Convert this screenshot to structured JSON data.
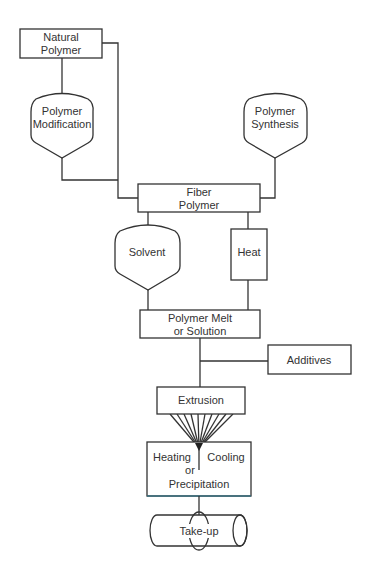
{
  "diagram": {
    "type": "flowchart",
    "colors": {
      "stroke": "#333333",
      "text": "#333333",
      "accent_edge": "#3a7080"
    },
    "nodes": {
      "natural_polymer": {
        "line1": "Natural",
        "line2": "Polymer",
        "shape": "rectangle"
      },
      "polymer_modification": {
        "line1": "Polymer",
        "line2": "Modification",
        "shape": "funnel"
      },
      "polymer_synthesis": {
        "line1": "Polymer",
        "line2": "Synthesis",
        "shape": "funnel"
      },
      "fiber_polymer": {
        "line1": "Fiber",
        "line2": "Polymer",
        "shape": "rectangle"
      },
      "solvent": {
        "line1": "Solvent",
        "shape": "funnel"
      },
      "heat": {
        "line1": "Heat",
        "shape": "rectangle"
      },
      "polymer_melt": {
        "line1": "Polymer Melt",
        "line2": "or Solution",
        "shape": "rectangle"
      },
      "additives": {
        "line1": "Additives",
        "shape": "rectangle"
      },
      "extrusion": {
        "line1": "Extrusion",
        "shape": "rectangle"
      },
      "heating_cooling": {
        "left": "Heating",
        "right": "Cooling",
        "line2": "or",
        "line3": "Precipitation",
        "shape": "rectangle"
      },
      "take_up": {
        "line1": "Take-up",
        "shape": "cylinder"
      }
    },
    "edges": [
      [
        "Natural Polymer",
        "Polymer Modification"
      ],
      [
        "Natural Polymer",
        "Fiber Polymer"
      ],
      [
        "Polymer Modification",
        "Fiber Polymer"
      ],
      [
        "Polymer Synthesis",
        "Fiber Polymer"
      ],
      [
        "Fiber Polymer",
        "Solvent"
      ],
      [
        "Fiber Polymer",
        "Heat"
      ],
      [
        "Solvent",
        "Polymer Melt or Solution"
      ],
      [
        "Heat",
        "Polymer Melt or Solution"
      ],
      [
        "Polymer Melt or Solution",
        "Extrusion"
      ],
      [
        "Additives",
        "Extrusion"
      ],
      [
        "Extrusion",
        "Heating Cooling or Precipitation"
      ],
      [
        "Heating Cooling or Precipitation",
        "Take-up"
      ]
    ]
  }
}
